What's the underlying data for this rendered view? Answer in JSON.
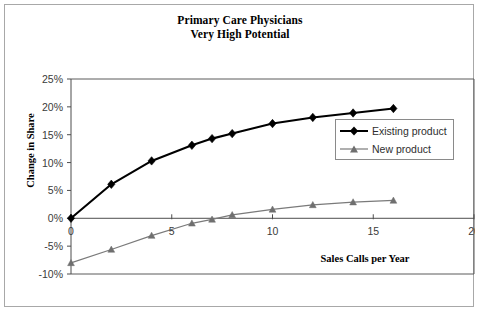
{
  "chart_data": {
    "type": "line",
    "title": "Primary Care Physicians\nVery High Potential",
    "title_line1": "Primary Care Physicians",
    "title_line2": "Very High Potential",
    "xlabel": "Sales Calls per Year",
    "ylabel": "Change in Share",
    "xlim": [
      0,
      20
    ],
    "ylim": [
      -10,
      25
    ],
    "xticks": [
      0,
      5,
      10,
      15,
      20
    ],
    "xtick_labels": [
      "0",
      "5",
      "10",
      "15",
      "20"
    ],
    "yticks": [
      -10,
      -5,
      0,
      5,
      10,
      15,
      20,
      25
    ],
    "ytick_labels": [
      "-10%",
      "-5%",
      "0%",
      "5%",
      "10%",
      "15%",
      "20%",
      "25%"
    ],
    "grid": false,
    "legend_position": "inside-right",
    "x": [
      0,
      2,
      4,
      6,
      7,
      8,
      10,
      12,
      14,
      16
    ],
    "series": [
      {
        "name": "Existing product",
        "marker": "diamond",
        "color": "#000000",
        "values": [
          0.0,
          6.1,
          10.3,
          13.1,
          14.3,
          15.2,
          17.0,
          18.1,
          18.9,
          19.7
        ]
      },
      {
        "name": "New product",
        "marker": "triangle",
        "color": "#7a7a7a",
        "values": [
          -8.0,
          -5.6,
          -3.1,
          -0.9,
          -0.2,
          0.6,
          1.6,
          2.4,
          2.9,
          3.2
        ]
      }
    ]
  },
  "legend": {
    "items": [
      {
        "label": "Existing product",
        "marker": "diamond-marker-icon"
      },
      {
        "label": "New product",
        "marker": "triangle-marker-icon"
      }
    ]
  },
  "colors": {
    "existing": "#000000",
    "new": "#7a7a7a",
    "axis": "#4d4d4d",
    "frame": "#5a5a5a",
    "card_border": "#a8a8a8",
    "background": "#ffffff"
  }
}
